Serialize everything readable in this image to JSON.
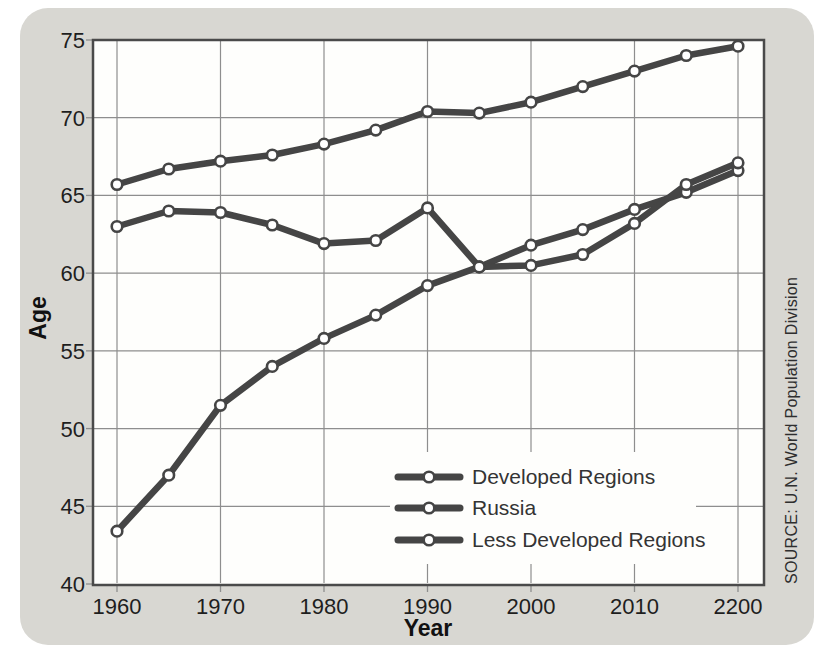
{
  "chart_data": {
    "type": "line",
    "title": "",
    "xlabel": "Year",
    "ylabel": "Age",
    "source": "SOURCE: U.N. World Population Division",
    "grid": true,
    "legend_position": "inside lower right",
    "ylim": [
      40,
      75
    ],
    "y_ticks": [
      40,
      45,
      50,
      55,
      60,
      65,
      70,
      75
    ],
    "x_tick_years": [
      1960,
      1970,
      1980,
      1990,
      2000,
      2010,
      2020
    ],
    "x_tick_labels": [
      "1960",
      "1970",
      "1980",
      "1990",
      "2000",
      "2010",
      "2200"
    ],
    "x": [
      1960,
      1965,
      1970,
      1975,
      1980,
      1985,
      1990,
      1995,
      2000,
      2005,
      2010,
      2015,
      2020
    ],
    "series": [
      {
        "name": "Developed Regions",
        "values": [
          65.7,
          66.7,
          67.2,
          67.6,
          68.3,
          69.2,
          70.4,
          70.3,
          71.0,
          72.0,
          73.0,
          74.0,
          74.6
        ]
      },
      {
        "name": "Russia",
        "values": [
          63.0,
          64.0,
          63.9,
          63.1,
          61.9,
          62.1,
          64.2,
          60.4,
          60.5,
          61.2,
          63.2,
          65.7,
          67.1
        ]
      },
      {
        "name": "Less Developed Regions",
        "values": [
          43.4,
          47.0,
          51.5,
          54.0,
          55.8,
          57.3,
          59.2,
          60.4,
          61.8,
          62.8,
          64.1,
          65.2,
          66.6
        ]
      }
    ],
    "colors": {
      "card_bg": "#d8d7d2",
      "plot_bg": "#fefefc",
      "line": "#454545",
      "grid": "#8e8e8e",
      "frame": "#4a4a4a",
      "marker_fill": "#ffffff",
      "text": "#1e1e1e"
    }
  }
}
